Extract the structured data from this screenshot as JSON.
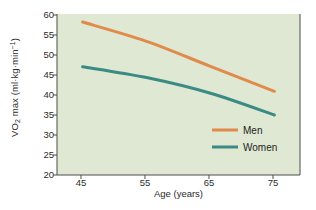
{
  "chart_data": {
    "type": "line",
    "title": "",
    "xlabel": "Age (years)",
    "ylabel": "VO2 max (ml·kg·min⁻¹)",
    "ylabel_parts": {
      "pre": "VO",
      "sub": "2",
      "mid": " max (ml·kg·min",
      "sup": "−1",
      "post": ")"
    },
    "x": [
      45,
      55,
      65,
      75
    ],
    "xlim": [
      41,
      79
    ],
    "ylim": [
      20,
      60
    ],
    "xticks": [
      "45",
      "55",
      "65",
      "75"
    ],
    "yticks": [
      "20",
      "25",
      "30",
      "35",
      "40",
      "45",
      "50",
      "55",
      "60"
    ],
    "grid": false,
    "legend_position": "lower-right-inside",
    "plot_background": "#dfe8d2",
    "series": [
      {
        "name": "Men",
        "color": "#e08b4c",
        "values": [
          58.0,
          53.2,
          47.0,
          40.8
        ]
      },
      {
        "name": "Women",
        "color": "#3b8b85",
        "values": [
          46.9,
          44.2,
          40.3,
          34.9
        ]
      }
    ]
  },
  "legend": {
    "items": [
      {
        "label": "Men",
        "color": "#e08b4c"
      },
      {
        "label": "Women",
        "color": "#3b8b85"
      }
    ]
  }
}
